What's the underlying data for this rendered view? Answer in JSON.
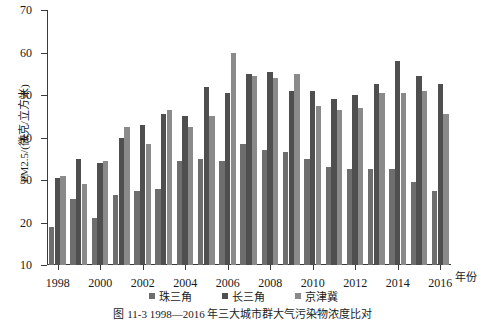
{
  "chart_data": {
    "type": "bar",
    "title": "",
    "xlabel": "年份",
    "ylabel": "PM2.5/(微克/立方米)",
    "ylim": [
      10,
      70
    ],
    "yticks": [
      10,
      20,
      30,
      40,
      50,
      60,
      70
    ],
    "grid": false,
    "legend_position": "bottom",
    "categories": [
      "1998",
      "1999",
      "2000",
      "2001",
      "2002",
      "2003",
      "2004",
      "2005",
      "2006",
      "2007",
      "2008",
      "2009",
      "2010",
      "2011",
      "2012",
      "2013",
      "2014",
      "2015",
      "2016"
    ],
    "xtick_labels": [
      "1998",
      "2000",
      "2002",
      "2004",
      "2006",
      "2008",
      "2010",
      "2012",
      "2014",
      "2016"
    ],
    "series": [
      {
        "name": "珠三角",
        "color": "#6e6e6e",
        "values": [
          19.0,
          25.5,
          21.0,
          26.5,
          27.5,
          28.0,
          34.5,
          35.0,
          34.5,
          38.5,
          37.0,
          36.5,
          35.0,
          33.0,
          32.5,
          32.5,
          32.5,
          29.5,
          27.5
        ]
      },
      {
        "name": "长三角",
        "color": "#4f4f4f",
        "values": [
          30.5,
          35.0,
          34.0,
          40.0,
          43.0,
          45.5,
          45.0,
          52.0,
          50.5,
          55.0,
          55.5,
          51.0,
          51.0,
          49.0,
          50.0,
          52.5,
          58.0,
          54.5,
          52.5
        ]
      },
      {
        "name": "京津冀",
        "color": "#8a8a8a",
        "values": [
          31.0,
          29.0,
          34.5,
          42.5,
          38.5,
          46.5,
          42.5,
          45.0,
          60.0,
          54.5,
          54.0,
          55.0,
          47.5,
          46.5,
          47.0,
          50.5,
          50.5,
          51.0,
          45.5
        ]
      }
    ]
  },
  "axis": {
    "y_title": "PM2.5/(微克/立方米)",
    "x_unit": "年份"
  },
  "legend": {
    "items": [
      {
        "label": "珠三角"
      },
      {
        "label": "长三角"
      },
      {
        "label": "京津冀"
      }
    ]
  },
  "caption": {
    "text": "图 11-3   1998—2016 年三大城市群大气污染物浓度比对"
  }
}
